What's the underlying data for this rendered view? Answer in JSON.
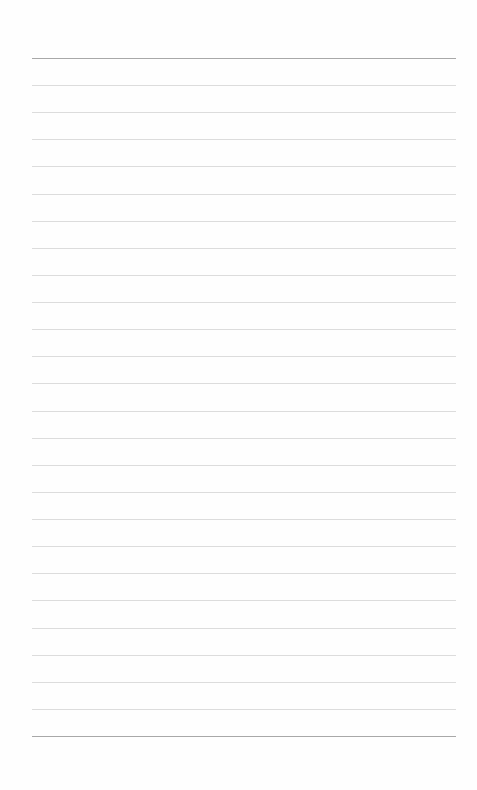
{
  "page": {
    "type": "lined-paper",
    "background_color": "#fefefe",
    "rule_color": "#dcdcdc",
    "edge_rule_color": "#a8a8a8",
    "line_left": 32,
    "line_right": 456,
    "first_line_y": 58,
    "last_line_y": 736,
    "line_count": 26,
    "line_spacing": 27.12
  }
}
